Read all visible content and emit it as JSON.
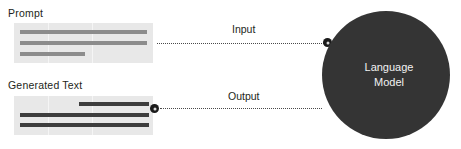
{
  "diagram": {
    "background_color": "#ffffff"
  },
  "prompt": {
    "label": "Prompt",
    "panel_color": "#e8e8e8",
    "bar_color": "#8c8c8c",
    "lines": [
      {
        "name": "prompt-line-1",
        "left": 6,
        "top": 7,
        "width": 127
      },
      {
        "name": "prompt-line-2",
        "left": 6,
        "top": 18,
        "width": 127
      },
      {
        "name": "prompt-line-3",
        "left": 6,
        "top": 29,
        "width": 65
      }
    ]
  },
  "generated_text": {
    "label": "Generated Text",
    "panel_color": "#e8e8e8",
    "bar_color": "#3d3d3d",
    "lines": [
      {
        "name": "generated-line-1",
        "left": 65,
        "top": 6,
        "width": 70
      },
      {
        "name": "generated-line-2",
        "left": 6,
        "top": 17,
        "width": 129
      },
      {
        "name": "generated-line-3",
        "left": 6,
        "top": 27,
        "width": 129
      }
    ]
  },
  "edges": {
    "input": {
      "label": "Input",
      "style": "dotted",
      "color": "#4a4a4a",
      "from": "prompt",
      "to": "language-model"
    },
    "output": {
      "label": "Output",
      "style": "dotted",
      "color": "#4a4a4a",
      "from": "language-model",
      "to": "generated-text"
    }
  },
  "language_model": {
    "label": "Language\nModel",
    "shape": "circle",
    "fill_color": "#343434",
    "text_color": "#f2f2f2"
  }
}
